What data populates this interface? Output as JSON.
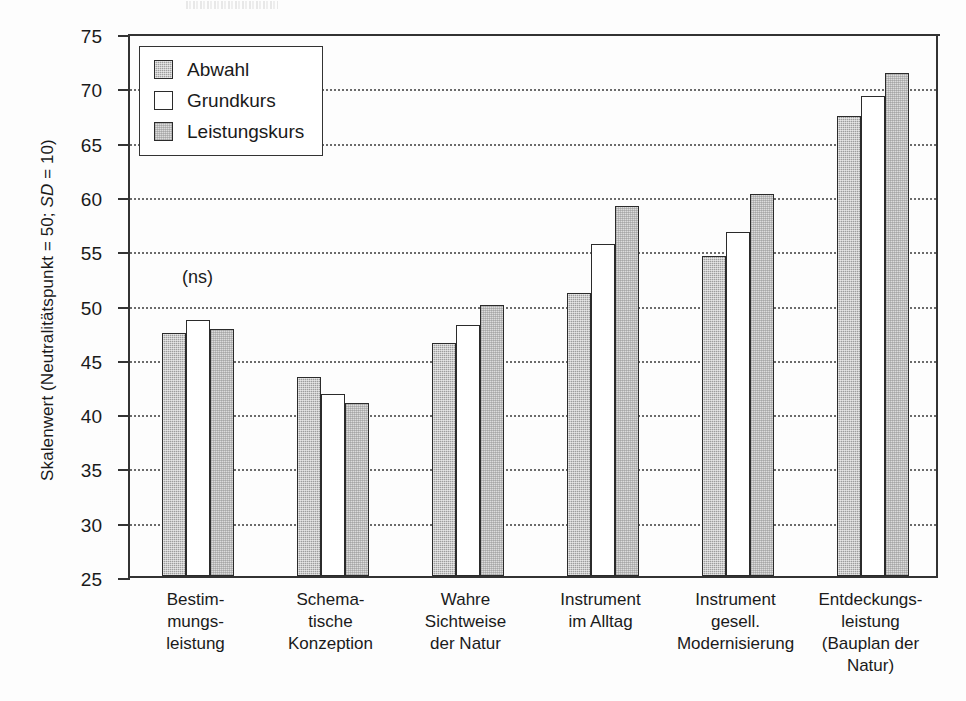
{
  "chart_data": {
    "type": "bar",
    "title": "",
    "xlabel": "",
    "ylabel": "Skalenwert (Neutralitätspunkt = 50; SD = 10)",
    "ylabel_parts": {
      "before_italic": "Skalenwert (Neutralitätspunkt = 50; ",
      "italic": "SD",
      "after_italic": " = 10)"
    },
    "ylim": [
      25,
      75
    ],
    "yticks": [
      25,
      30,
      35,
      40,
      45,
      50,
      55,
      60,
      65,
      70,
      75
    ],
    "grid": "horizontal-dotted",
    "legend_position": "top-left-inside",
    "categories": [
      "Bestim-\nmungs-\nleistung",
      "Schema-\ntische\nKonzeption",
      "Wahre\nSichtweise\nder Natur",
      "Instrument\nim Alltag",
      "Instrument\ngesell.\nModernisierung",
      "Entdeckungs-\nleistung\n(Bauplan der\nNatur)"
    ],
    "series": [
      {
        "name": "Abwahl",
        "values": [
          47.4,
          43.3,
          46.5,
          51.1,
          54.5,
          67.4
        ]
      },
      {
        "name": "Grundkurs",
        "values": [
          48.6,
          41.8,
          48.1,
          55.6,
          56.7,
          69.2
        ]
      },
      {
        "name": "Leistungskurs",
        "values": [
          47.7,
          40.9,
          50.0,
          59.1,
          60.2,
          71.3
        ]
      }
    ],
    "annotations": [
      {
        "text": "(ns)",
        "category_index": 0,
        "value": 52.5
      }
    ],
    "colors": {
      "abwahl": "#9e9e9e",
      "grundkurs": "#ffffff",
      "leistungskurs": "#dcdcdc",
      "axis": "#333333",
      "grid": "#6b6b6b",
      "background": "#fdfdfd"
    }
  }
}
